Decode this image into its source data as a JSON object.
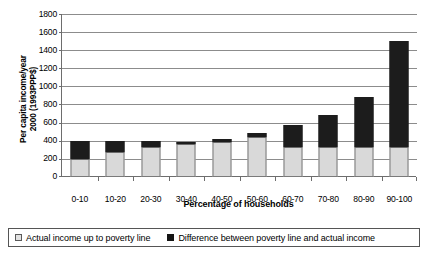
{
  "chart_data": {
    "type": "bar",
    "title": "",
    "subtitle": "",
    "xlabel": "Percentage of households",
    "ylabel": "Per capita income/year 2000 (1993PPP$)",
    "ylabel_line1": "Per capita income/year",
    "ylabel_line2": "2000 (1993PPP$)",
    "stacked": true,
    "grid": true,
    "legend_position": "bottom",
    "ylim": [
      0,
      1800
    ],
    "yticks": [
      0,
      200,
      400,
      600,
      800,
      1000,
      1200,
      1400,
      1600,
      1800
    ],
    "ytick_labels": [
      "0",
      "200",
      "400",
      "600",
      "800",
      "1000",
      "1200",
      "1400",
      "1600",
      "1800"
    ],
    "categories": [
      "0-10",
      "10-20",
      "20-30",
      "30-40",
      "40-50",
      "50-60",
      "60-70",
      "70-80",
      "80-90",
      "90-100"
    ],
    "series": [
      {
        "name": "Actual income up to poverty line",
        "color": "#d9d9d9",
        "values": [
          200,
          280,
          330,
          360,
          390,
          440,
          330,
          330,
          330,
          330
        ]
      },
      {
        "name": "Difference between poverty line and actual income",
        "color": "#1c1c1c",
        "values": [
          200,
          120,
          70,
          30,
          30,
          50,
          250,
          350,
          550,
          1170
        ]
      }
    ],
    "totals": [
      400,
      400,
      400,
      390,
      420,
      490,
      580,
      680,
      880,
      1500
    ]
  },
  "legend": {
    "items": [
      {
        "label": "Actual income up to poverty line",
        "swatch": "light-gray-square"
      },
      {
        "label": "Difference between poverty line and actual income",
        "swatch": "black-square"
      }
    ]
  }
}
